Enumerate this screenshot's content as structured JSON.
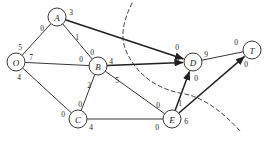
{
  "diagram": {
    "type": "directed-graph-flow-network",
    "canvas": {
      "width": 274,
      "height": 142
    },
    "colors": {
      "stroke": "#231f20",
      "cut": "#2b2b2b",
      "node_fill": "#ffffff",
      "background": "#ffffff"
    },
    "nodes": [
      {
        "id": "O",
        "label": "O",
        "x": 16,
        "y": 62,
        "r": 9
      },
      {
        "id": "A",
        "label": "A",
        "x": 57,
        "y": 17,
        "r": 9
      },
      {
        "id": "B",
        "label": "B",
        "x": 98,
        "y": 66,
        "r": 9
      },
      {
        "id": "C",
        "label": "C",
        "x": 78,
        "y": 119,
        "r": 9
      },
      {
        "id": "D",
        "label": "D",
        "x": 193,
        "y": 62,
        "r": 9
      },
      {
        "id": "E",
        "label": "E",
        "x": 172,
        "y": 119,
        "r": 9
      },
      {
        "id": "T",
        "label": "T",
        "x": 252,
        "y": 50,
        "r": 9
      }
    ],
    "edges": [
      {
        "id": "O-A",
        "from": "O",
        "to": "A",
        "arrow": false,
        "thick": false,
        "tail_label": "5",
        "tail_x": 20,
        "tail_y": 47,
        "head_label": "0",
        "head_x": 42,
        "head_y": 28
      },
      {
        "id": "A-D",
        "from": "A",
        "to": "D",
        "arrow": true,
        "thick": true,
        "tail_label": "3",
        "tail_x": 71,
        "tail_y": 12,
        "head_label": "0",
        "head_x": 177,
        "head_y": 47
      },
      {
        "id": "A-B",
        "from": "A",
        "to": "B",
        "arrow": false,
        "thick": false,
        "tail_label": "1",
        "tail_x": 77,
        "tail_y": 37,
        "head_label": "0",
        "head_x": 92,
        "head_y": 52
      },
      {
        "id": "O-B",
        "from": "O",
        "to": "B",
        "arrow": false,
        "thick": false,
        "tail_label": "7",
        "tail_x": 31,
        "tail_y": 57,
        "head_label": "0",
        "head_x": 81,
        "head_y": 59
      },
      {
        "id": "O-C",
        "from": "O",
        "to": "C",
        "arrow": false,
        "thick": false,
        "tail_label": "4",
        "tail_x": 19,
        "tail_y": 77,
        "head_label": "0",
        "head_x": 63,
        "head_y": 114
      },
      {
        "id": "B-C",
        "from": "B",
        "to": "C",
        "arrow": false,
        "thick": false,
        "tail_label": "2",
        "tail_x": 89,
        "tail_y": 85,
        "head_label": "0",
        "head_x": 80,
        "head_y": 104
      },
      {
        "id": "B-D",
        "from": "B",
        "to": "D",
        "arrow": true,
        "thick": true,
        "tail_label": "4",
        "tail_x": 111,
        "tail_y": 61,
        "head_label": "0",
        "head_x": 177,
        "head_y": 61
      },
      {
        "id": "B-E",
        "from": "B",
        "to": "E",
        "arrow": false,
        "thick": false,
        "tail_label": "5",
        "tail_x": 117,
        "tail_y": 80,
        "head_label": "0",
        "head_x": 158,
        "head_y": 105
      },
      {
        "id": "C-E",
        "from": "C",
        "to": "E",
        "arrow": false,
        "thick": false,
        "tail_label": "4",
        "tail_x": 91,
        "tail_y": 127,
        "head_label": "0",
        "head_x": 157,
        "head_y": 127
      },
      {
        "id": "D-T",
        "from": "D",
        "to": "T",
        "arrow": false,
        "thick": false,
        "tail_label": "9",
        "tail_x": 206,
        "tail_y": 54,
        "head_label": "0",
        "head_x": 236,
        "head_y": 42
      },
      {
        "id": "E-D",
        "from": "E",
        "to": "D",
        "arrow": true,
        "thick": true,
        "tail_label": "1",
        "tail_x": 180,
        "tail_y": 103,
        "head_label": "0",
        "head_x": 196,
        "head_y": 78
      },
      {
        "id": "E-T",
        "from": "E",
        "to": "T",
        "arrow": true,
        "thick": true,
        "tail_label": "6",
        "tail_x": 186,
        "tail_y": 121,
        "head_label": "0",
        "head_x": 246,
        "head_y": 64
      }
    ],
    "cut_curve": {
      "id": "min-cut",
      "style": "dashed",
      "path": "M 132 3 C 123 22 119 38 128 55 C 140 78 160 90 185 94 C 205 98 225 114 241 132"
    }
  }
}
